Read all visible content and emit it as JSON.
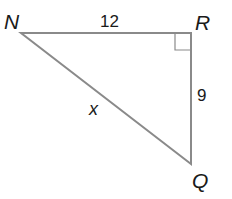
{
  "diagram": {
    "type": "right-triangle",
    "vertices": {
      "N": "N",
      "R": "R",
      "Q": "Q"
    },
    "sides": {
      "NR": "12",
      "RQ": "9",
      "NQ": "x"
    },
    "right_angle_at": "R",
    "colors": {
      "stroke": "#8a8a8a",
      "text": "#1a1a1a"
    }
  }
}
